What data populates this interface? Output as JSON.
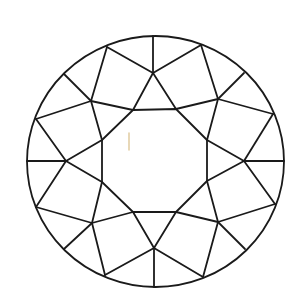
{
  "diagram": {
    "colors": {
      "line": "#1a1a1a",
      "background": "#ffffff",
      "mark": "#e3cfa6"
    },
    "girdle": {
      "cx": 155.5,
      "cy": 161.5,
      "rx": 128.5,
      "ry": 125.5
    },
    "table": [
      [
        133,
        110
      ],
      [
        176,
        109
      ],
      [
        207,
        140
      ],
      [
        207,
        181
      ],
      [
        176,
        212
      ],
      [
        133,
        212
      ],
      [
        102,
        182
      ],
      [
        102,
        140
      ]
    ],
    "stars": [
      [
        153,
        73
      ],
      [
        218,
        99
      ],
      [
        244,
        161
      ],
      [
        218,
        222
      ],
      [
        154,
        248
      ],
      [
        92,
        223
      ],
      [
        66,
        161
      ],
      [
        91,
        101
      ]
    ],
    "rim_main": [
      [
        153,
        36
      ],
      [
        244,
        73
      ],
      [
        284,
        161
      ],
      [
        245,
        249
      ],
      [
        154,
        287
      ],
      [
        64,
        249
      ],
      [
        27,
        161
      ],
      [
        64,
        74
      ]
    ],
    "rim_upper_girdle": [
      [
        201,
        45
      ],
      [
        273,
        114
      ],
      [
        275,
        204
      ],
      [
        203,
        277
      ],
      [
        105,
        275
      ],
      [
        36,
        207
      ],
      [
        36,
        119
      ],
      [
        107,
        47
      ]
    ],
    "mark": [
      [
        129,
        133
      ],
      [
        129,
        150
      ]
    ]
  }
}
